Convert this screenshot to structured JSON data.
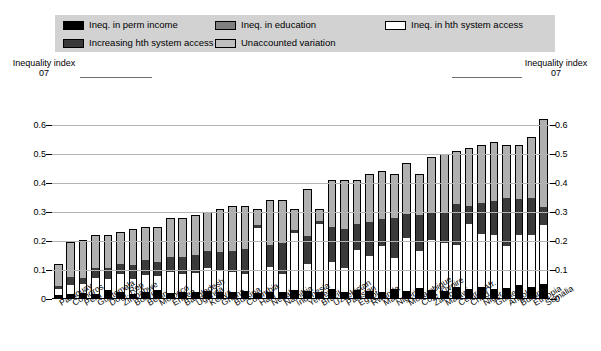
{
  "legend": {
    "columns": [
      {
        "items": [
          {
            "label": "Ineq. in perm income",
            "swatch": "black",
            "icon": "legend-swatch-black"
          },
          {
            "label": "Increasing hth system access",
            "swatch": "dark",
            "icon": "legend-swatch-dark-gray"
          }
        ]
      },
      {
        "items": [
          {
            "label": "Ineq. in education",
            "swatch": "mid",
            "icon": "legend-swatch-mid-gray"
          },
          {
            "label": "Unaccounted variation",
            "swatch": "light",
            "icon": "legend-swatch-light-gray"
          }
        ]
      },
      {
        "items": [
          {
            "label": "Ineq. in hth system access",
            "swatch": "white",
            "icon": "legend-swatch-white"
          }
        ]
      }
    ]
  },
  "axis_headers": {
    "left": {
      "line1": "Inequality index",
      "line2": "07"
    },
    "right": {
      "line1": "Inequality index",
      "line2": "07"
    }
  },
  "chart_data": {
    "type": "bar",
    "title": "",
    "subtitle": "",
    "xlabel": "",
    "ylabel": "Inequality index 07",
    "ylim": [
      0,
      0.7
    ],
    "yticks": [
      "0",
      "0.1",
      "0.2",
      "0.3",
      "0.4",
      "0.5",
      "0.6"
    ],
    "ytick_values": [
      0,
      0.1,
      0.2,
      0.3,
      0.4,
      0.5,
      0.6
    ],
    "grid": true,
    "stacked": true,
    "legend_position": "top",
    "series": [
      {
        "name": "Ineq. in perm income",
        "color": "#000000",
        "values": [
          0.01,
          0.015,
          0.018,
          0.014,
          0.028,
          0.02,
          0.016,
          0.02,
          0.03,
          0.018,
          0.022,
          0.02,
          0.025,
          0.022,
          0.02,
          0.024,
          0.018,
          0.02,
          0.022,
          0.028,
          0.026,
          0.02,
          0.03,
          0.022,
          0.028,
          0.026,
          0.022,
          0.03,
          0.024,
          0.035,
          0.028,
          0.026,
          0.04,
          0.03,
          0.038,
          0.03,
          0.036,
          0.045,
          0.04,
          0.048
        ]
      },
      {
        "name": "Ineq. in hth system access",
        "color": "#ffffff",
        "values": [
          0.022,
          0.03,
          0.032,
          0.056,
          0.038,
          0.065,
          0.052,
          0.06,
          0.048,
          0.075,
          0.062,
          0.068,
          0.082,
          0.078,
          0.07,
          0.062,
          0.23,
          0.088,
          0.062,
          0.2,
          0.092,
          0.24,
          0.098,
          0.085,
          0.14,
          0.12,
          0.16,
          0.11,
          0.185,
          0.13,
          0.175,
          0.165,
          0.145,
          0.23,
          0.185,
          0.19,
          0.145,
          0.175,
          0.18,
          0.205
        ]
      },
      {
        "name": "Increasing hth system access",
        "color": "#3a3a3a",
        "values": [
          0.012,
          0.03,
          0.02,
          0.038,
          0.042,
          0.035,
          0.05,
          0.055,
          0.048,
          0.052,
          0.06,
          0.065,
          0.058,
          0.062,
          0.075,
          0.088,
          0.01,
          0.078,
          0.11,
          0.012,
          0.1,
          0.01,
          0.12,
          0.135,
          0.09,
          0.12,
          0.095,
          0.14,
          0.085,
          0.125,
          0.095,
          0.11,
          0.145,
          0.06,
          0.11,
          0.12,
          0.17,
          0.125,
          0.13,
          0.065
        ]
      },
      {
        "name": "Unaccounted variation",
        "color": "#b0b0b0",
        "values": [
          0.076,
          0.12,
          0.135,
          0.112,
          0.112,
          0.11,
          0.122,
          0.115,
          0.124,
          0.135,
          0.136,
          0.137,
          0.135,
          0.148,
          0.155,
          0.146,
          0.052,
          0.154,
          0.146,
          0.07,
          0.162,
          0.04,
          0.162,
          0.168,
          0.152,
          0.164,
          0.163,
          0.15,
          0.176,
          0.142,
          0.192,
          0.199,
          0.18,
          0.2,
          0.197,
          0.2,
          0.179,
          0.185,
          0.21,
          0.302
        ]
      }
    ],
    "categories": [
      "Paraguay",
      "Comoros",
      "Peru",
      "Guatemala",
      "Dom. Rep",
      "Zimbabwe",
      "Bolivia",
      "Benin",
      "Morocco",
      "Eritrea",
      "Bangladesh",
      "Uganda",
      "Kenya",
      "Ghana",
      "Burkina",
      "Colombia",
      "Haiti",
      "Nepal",
      "Namibia",
      "Indonesia",
      "Yemen",
      "Brazil",
      "Uzbekistan",
      "Pakistan",
      "Egypt",
      "Rwanda",
      "Mali",
      "Nigeria",
      "Mozambique",
      "Cote d'Ivoire",
      "Zambia",
      "Malawi",
      "Central Afr.",
      "Chad",
      "Niger",
      "Guinea",
      "Angola",
      "Burundi",
      "Ethiopia",
      "Somalia"
    ]
  }
}
